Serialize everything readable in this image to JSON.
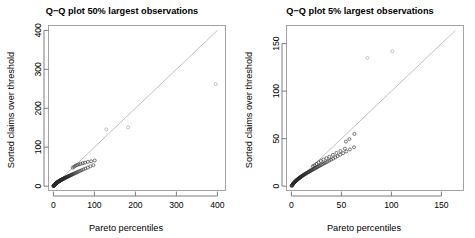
{
  "figure": {
    "width": 475,
    "height": 238,
    "background": "#ffffff",
    "panel_count": 2
  },
  "chart_data": [
    {
      "type": "scatter",
      "panel": "left",
      "title": "Q−Q plot 50% largest observations",
      "xlabel": "Pareto percentiles",
      "ylabel": "Sorted claims over threshold",
      "xlim": [
        -12,
        420
      ],
      "ylim": [
        -12,
        420
      ],
      "xticks": [
        0,
        100,
        200,
        300,
        400
      ],
      "yticks": [
        0,
        100,
        200,
        300,
        400
      ],
      "xticklabels": [
        "0",
        "100",
        "200",
        "300",
        "400"
      ],
      "yticklabels": [
        "0",
        "100",
        "200",
        "300",
        "400"
      ],
      "grid": false,
      "legend": false,
      "reference_line": {
        "type": "identity",
        "slope": 1,
        "intercept": 0,
        "color": "#b4b4b4",
        "from": [
          0,
          0
        ],
        "to": [
          400,
          400
        ]
      },
      "point_style": {
        "marker": "open-circle",
        "radius": 1.5,
        "color": "#2a2a2a"
      },
      "points": [
        [
          0.2,
          0.4
        ],
        [
          0.4,
          0.7
        ],
        [
          0.6,
          0.9
        ],
        [
          0.8,
          1.2
        ],
        [
          1.0,
          1.4
        ],
        [
          1.2,
          1.7
        ],
        [
          1.4,
          1.9
        ],
        [
          1.6,
          2.2
        ],
        [
          1.8,
          2.4
        ],
        [
          2.0,
          2.7
        ],
        [
          2.2,
          2.9
        ],
        [
          2.4,
          3.1
        ],
        [
          2.6,
          3.4
        ],
        [
          2.8,
          3.6
        ],
        [
          3.0,
          3.8
        ],
        [
          3.2,
          4.1
        ],
        [
          3.5,
          4.3
        ],
        [
          3.7,
          4.6
        ],
        [
          3.9,
          4.8
        ],
        [
          4.1,
          5.0
        ],
        [
          4.4,
          5.3
        ],
        [
          4.6,
          5.5
        ],
        [
          4.9,
          5.8
        ],
        [
          5.1,
          6.0
        ],
        [
          5.4,
          6.2
        ],
        [
          5.6,
          6.5
        ],
        [
          5.9,
          6.7
        ],
        [
          6.2,
          7.0
        ],
        [
          6.4,
          7.2
        ],
        [
          6.7,
          7.5
        ],
        [
          7.0,
          7.7
        ],
        [
          7.3,
          8.0
        ],
        [
          7.6,
          8.2
        ],
        [
          7.9,
          8.5
        ],
        [
          8.2,
          8.7
        ],
        [
          8.5,
          9.0
        ],
        [
          8.8,
          9.2
        ],
        [
          9.1,
          9.5
        ],
        [
          9.5,
          9.8
        ],
        [
          9.8,
          10.0
        ],
        [
          10.2,
          10.3
        ],
        [
          10.5,
          10.6
        ],
        [
          10.9,
          10.8
        ],
        [
          11.3,
          11.1
        ],
        [
          11.6,
          11.4
        ],
        [
          12.0,
          11.7
        ],
        [
          12.4,
          11.9
        ],
        [
          12.8,
          12.2
        ],
        [
          13.3,
          12.5
        ],
        [
          13.7,
          12.8
        ],
        [
          14.1,
          13.1
        ],
        [
          14.6,
          13.4
        ],
        [
          15.1,
          13.7
        ],
        [
          15.5,
          14.0
        ],
        [
          16.0,
          14.3
        ],
        [
          16.5,
          14.6
        ],
        [
          17.1,
          14.9
        ],
        [
          17.6,
          15.3
        ],
        [
          18.2,
          15.6
        ],
        [
          18.7,
          15.9
        ],
        [
          19.3,
          16.3
        ],
        [
          19.9,
          16.6
        ],
        [
          20.6,
          17.0
        ],
        [
          21.2,
          17.4
        ],
        [
          21.9,
          17.7
        ],
        [
          22.6,
          18.1
        ],
        [
          23.3,
          18.5
        ],
        [
          24.0,
          18.9
        ],
        [
          24.8,
          19.3
        ],
        [
          25.6,
          19.8
        ],
        [
          26.4,
          20.2
        ],
        [
          27.3,
          20.7
        ],
        [
          28.2,
          21.1
        ],
        [
          29.1,
          21.6
        ],
        [
          30.1,
          22.1
        ],
        [
          31.1,
          22.7
        ],
        [
          32.2,
          23.2
        ],
        [
          33.3,
          23.8
        ],
        [
          34.5,
          24.4
        ],
        [
          35.7,
          25.0
        ],
        [
          37.0,
          25.7
        ],
        [
          38.4,
          26.4
        ],
        [
          39.9,
          27.1
        ],
        [
          41.4,
          27.9
        ],
        [
          43.1,
          28.7
        ],
        [
          44.9,
          29.6
        ],
        [
          46.8,
          30.5
        ],
        [
          48.8,
          31.5
        ],
        [
          51.0,
          32.6
        ],
        [
          53.4,
          33.7
        ],
        [
          56.0,
          35.0
        ],
        [
          58.8,
          36.3
        ],
        [
          61.9,
          37.8
        ],
        [
          65.3,
          39.4
        ],
        [
          69.1,
          41.2
        ],
        [
          73.4,
          43.2
        ],
        [
          78.2,
          45.4
        ],
        [
          83.7,
          47.9
        ],
        [
          90.1,
          50.8
        ],
        [
          97.6,
          54.1
        ],
        [
          47.0,
          47.5
        ],
        [
          50.5,
          50.0
        ],
        [
          54.0,
          52.5
        ],
        [
          58.0,
          54.5
        ],
        [
          62.0,
          56.0
        ],
        [
          66.5,
          57.5
        ],
        [
          71.5,
          59.0
        ],
        [
          77.0,
          60.5
        ],
        [
          84.0,
          62.5
        ],
        [
          92.0,
          64.0
        ],
        [
          101.0,
          66.0
        ],
        [
          129.0,
          146.0
        ],
        [
          182.0,
          151.0
        ],
        [
          396.0,
          262.0
        ]
      ],
      "notable_points": [
        {
          "x": 129,
          "y": 146,
          "note": "above reference line"
        },
        {
          "x": 182,
          "y": 151,
          "note": "below reference line"
        },
        {
          "x": 396,
          "y": 262,
          "note": "far outlier, well below reference line"
        }
      ]
    },
    {
      "type": "scatter",
      "panel": "right",
      "title": "Q−Q plot 5% largest observations",
      "xlabel": "Pareto percentiles",
      "ylabel": "Sorted claims over threshold",
      "xlim": [
        -6,
        190
      ],
      "ylim": [
        -6,
        190
      ],
      "xticks": [
        0,
        50,
        100,
        150
      ],
      "yticks": [
        0,
        50,
        100,
        150
      ],
      "xticklabels": [
        "0",
        "50",
        "100",
        "150"
      ],
      "yticklabels": [
        "0",
        "50",
        "100",
        "150"
      ],
      "grid": false,
      "legend": false,
      "reference_line": {
        "type": "identity",
        "slope": 1,
        "intercept": 0,
        "color": "#b4b4b4",
        "from": [
          0,
          0
        ],
        "to": [
          182,
          182
        ]
      },
      "point_style": {
        "marker": "open-circle",
        "radius": 1.5,
        "color": "#2a2a2a"
      },
      "points": [
        [
          0.2,
          0.3
        ],
        [
          0.4,
          0.6
        ],
        [
          0.6,
          0.9
        ],
        [
          0.8,
          1.2
        ],
        [
          1.0,
          1.5
        ],
        [
          1.2,
          1.8
        ],
        [
          1.4,
          2.1
        ],
        [
          1.6,
          2.4
        ],
        [
          1.8,
          2.6
        ],
        [
          2.0,
          2.9
        ],
        [
          2.3,
          3.2
        ],
        [
          2.5,
          3.5
        ],
        [
          2.7,
          3.7
        ],
        [
          3.0,
          4.0
        ],
        [
          3.2,
          4.3
        ],
        [
          3.5,
          4.6
        ],
        [
          3.7,
          4.8
        ],
        [
          4.0,
          5.1
        ],
        [
          4.2,
          5.4
        ],
        [
          4.5,
          5.6
        ],
        [
          4.8,
          5.9
        ],
        [
          5.1,
          6.2
        ],
        [
          5.4,
          6.4
        ],
        [
          5.7,
          6.7
        ],
        [
          6.0,
          7.0
        ],
        [
          6.3,
          7.3
        ],
        [
          6.6,
          7.5
        ],
        [
          6.9,
          7.8
        ],
        [
          7.2,
          8.1
        ],
        [
          7.6,
          8.4
        ],
        [
          7.9,
          8.6
        ],
        [
          8.3,
          8.9
        ],
        [
          8.6,
          9.2
        ],
        [
          9.0,
          9.5
        ],
        [
          9.4,
          9.8
        ],
        [
          9.8,
          10.1
        ],
        [
          10.2,
          10.4
        ],
        [
          10.6,
          10.7
        ],
        [
          11.0,
          11.0
        ],
        [
          11.4,
          11.3
        ],
        [
          11.9,
          11.6
        ],
        [
          12.3,
          11.9
        ],
        [
          12.8,
          12.2
        ],
        [
          13.3,
          12.6
        ],
        [
          13.8,
          12.9
        ],
        [
          14.3,
          13.2
        ],
        [
          14.8,
          13.6
        ],
        [
          15.4,
          13.9
        ],
        [
          16.0,
          14.3
        ],
        [
          16.6,
          14.7
        ],
        [
          17.2,
          15.0
        ],
        [
          17.8,
          15.4
        ],
        [
          18.5,
          15.8
        ],
        [
          19.2,
          16.2
        ],
        [
          19.9,
          16.7
        ],
        [
          20.6,
          17.1
        ],
        [
          21.4,
          17.6
        ],
        [
          22.2,
          18.0
        ],
        [
          23.1,
          18.5
        ],
        [
          24.0,
          19.0
        ],
        [
          24.9,
          19.6
        ],
        [
          25.9,
          20.1
        ],
        [
          26.9,
          20.7
        ],
        [
          28.0,
          21.3
        ],
        [
          29.2,
          22.0
        ],
        [
          30.4,
          22.7
        ],
        [
          31.7,
          23.4
        ],
        [
          33.1,
          24.2
        ],
        [
          34.6,
          25.0
        ],
        [
          36.2,
          25.9
        ],
        [
          37.9,
          26.9
        ],
        [
          39.7,
          27.9
        ],
        [
          41.7,
          29.0
        ],
        [
          43.9,
          30.3
        ],
        [
          46.2,
          31.6
        ],
        [
          48.8,
          33.1
        ],
        [
          51.7,
          34.8
        ],
        [
          54.9,
          36.6
        ],
        [
          58.5,
          38.7
        ],
        [
          62.6,
          41.0
        ],
        [
          21.5,
          21.0
        ],
        [
          23.0,
          22.0
        ],
        [
          25.0,
          23.5
        ],
        [
          27.0,
          25.0
        ],
        [
          29.5,
          26.5
        ],
        [
          32.0,
          28.0
        ],
        [
          35.0,
          29.5
        ],
        [
          38.0,
          31.0
        ],
        [
          41.5,
          33.0
        ],
        [
          45.0,
          35.0
        ],
        [
          49.0,
          37.0
        ],
        [
          53.5,
          39.5
        ],
        [
          54.5,
          47.0
        ],
        [
          58.0,
          49.5
        ],
        [
          63.0,
          55.0
        ],
        [
          76.0,
          135.0
        ],
        [
          101.0,
          142.0
        ]
      ],
      "notable_points": [
        {
          "x": 76,
          "y": 135,
          "note": "far outlier above reference line"
        },
        {
          "x": 101,
          "y": 142,
          "note": "far outlier above reference line"
        }
      ]
    }
  ]
}
